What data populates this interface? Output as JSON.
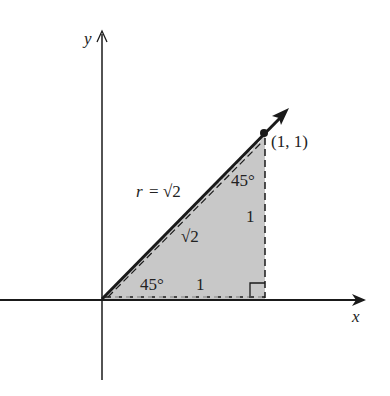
{
  "diagram": {
    "axes": {
      "x_label": "x",
      "y_label": "y"
    },
    "point": {
      "label": "(1, 1)",
      "x": 1,
      "y": 1
    },
    "vector": {
      "label": "r = √2",
      "r_symbol": "r",
      "equals": "=",
      "value": "√2"
    },
    "triangle": {
      "hypotenuse_label": "√2",
      "vertical_side_label": "1",
      "horizontal_side_label": "1",
      "top_angle_label": "45°",
      "bottom_angle_label": "45°",
      "fill_color": "#c8c8c8"
    },
    "colors": {
      "ink": "#1a1a1a",
      "shade": "#c8c8c8",
      "background": "#ffffff"
    }
  }
}
